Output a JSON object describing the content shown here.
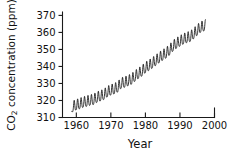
{
  "chart_data": {
    "type": "line",
    "title": "",
    "subtitle": "",
    "xlabel": "Year",
    "ylabel_main": "concentration (ppm)",
    "ylabel_prefix": "CO",
    "ylabel_subscript": "2",
    "ylabel_full": "CO2 concentration (ppm)",
    "xlim": [
      1956,
      2000
    ],
    "ylim": [
      310,
      372
    ],
    "xticks": [
      1960,
      1970,
      1980,
      1990,
      2000
    ],
    "xtick_labels": [
      "1960",
      "1970",
      "1980",
      "1990",
      "2000"
    ],
    "yticks": [
      310,
      320,
      330,
      340,
      350,
      360,
      370
    ],
    "ytick_labels": [
      "310",
      "320",
      "330",
      "340",
      "350",
      "360",
      "370"
    ],
    "grid": false,
    "legend": "none",
    "line_color": "#121212",
    "axis_color": "#1a1a1a",
    "background_color": "#ffffff",
    "series_name": "Atmospheric CO2 at Mauna Loa",
    "seasonal_amplitude_ppm": 3.1,
    "data_start_year": 1958.7,
    "data_end_year": 1997.4,
    "annual_mean": [
      {
        "year": 1958.7,
        "ppm": 315.4
      },
      {
        "year": 1959,
        "ppm": 315.98
      },
      {
        "year": 1960,
        "ppm": 316.91
      },
      {
        "year": 1961,
        "ppm": 317.64
      },
      {
        "year": 1962,
        "ppm": 318.45
      },
      {
        "year": 1963,
        "ppm": 318.99
      },
      {
        "year": 1964,
        "ppm": 319.62
      },
      {
        "year": 1965,
        "ppm": 320.04
      },
      {
        "year": 1966,
        "ppm": 321.38
      },
      {
        "year": 1967,
        "ppm": 322.16
      },
      {
        "year": 1968,
        "ppm": 323.04
      },
      {
        "year": 1969,
        "ppm": 324.62
      },
      {
        "year": 1970,
        "ppm": 325.68
      },
      {
        "year": 1971,
        "ppm": 326.32
      },
      {
        "year": 1972,
        "ppm": 327.45
      },
      {
        "year": 1973,
        "ppm": 329.68
      },
      {
        "year": 1974,
        "ppm": 330.18
      },
      {
        "year": 1975,
        "ppm": 331.11
      },
      {
        "year": 1976,
        "ppm": 332.04
      },
      {
        "year": 1977,
        "ppm": 333.83
      },
      {
        "year": 1978,
        "ppm": 335.4
      },
      {
        "year": 1979,
        "ppm": 336.84
      },
      {
        "year": 1980,
        "ppm": 338.75
      },
      {
        "year": 1981,
        "ppm": 340.11
      },
      {
        "year": 1982,
        "ppm": 341.45
      },
      {
        "year": 1983,
        "ppm": 343.05
      },
      {
        "year": 1984,
        "ppm": 344.65
      },
      {
        "year": 1985,
        "ppm": 346.12
      },
      {
        "year": 1986,
        "ppm": 347.42
      },
      {
        "year": 1987,
        "ppm": 349.19
      },
      {
        "year": 1988,
        "ppm": 351.57
      },
      {
        "year": 1989,
        "ppm": 353.12
      },
      {
        "year": 1990,
        "ppm": 354.39
      },
      {
        "year": 1991,
        "ppm": 355.61
      },
      {
        "year": 1992,
        "ppm": 356.45
      },
      {
        "year": 1993,
        "ppm": 357.1
      },
      {
        "year": 1994,
        "ppm": 358.83
      },
      {
        "year": 1995,
        "ppm": 360.82
      },
      {
        "year": 1996,
        "ppm": 362.61
      },
      {
        "year": 1997.4,
        "ppm": 363.7
      }
    ]
  }
}
